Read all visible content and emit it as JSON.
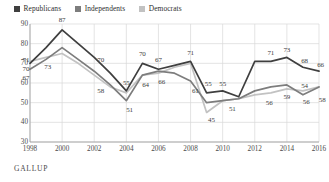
{
  "legend": {
    "position": "top-left",
    "items": [
      {
        "label": "Republicans",
        "color": "#3f3f3f",
        "icon": "legend-swatch-icon"
      },
      {
        "label": "Independents",
        "color": "#7d7d7d",
        "icon": "legend-swatch-icon"
      },
      {
        "label": "Democrats",
        "color": "#c2c2c2",
        "icon": "legend-swatch-icon"
      }
    ]
  },
  "source": {
    "label": "GALLUP"
  },
  "chart_data": {
    "type": "line",
    "title": "",
    "subtitle": "",
    "xlabel": "",
    "ylabel": "",
    "grid": true,
    "legend_position": "top-left",
    "ylim": [
      30,
      90
    ],
    "yticks": [
      30,
      40,
      50,
      60,
      70,
      80,
      90
    ],
    "xlim": [
      1998,
      2016
    ],
    "xticks": [
      1998,
      2000,
      2002,
      2004,
      2006,
      2008,
      2010,
      2012,
      2014,
      2016
    ],
    "x": [
      1998,
      1999,
      2000,
      2001,
      2002,
      2003,
      2004,
      2005,
      2006,
      2007,
      2008,
      2009,
      2010,
      2011,
      2012,
      2013,
      2014,
      2015,
      2016
    ],
    "series": [
      {
        "name": "Republicans",
        "color": "#3f3f3f",
        "values": [
          70,
          78,
          87,
          80,
          73,
          65,
          56,
          70,
          67,
          69,
          71,
          55,
          56,
          53,
          71,
          71,
          73,
          68,
          66
        ]
      },
      {
        "name": "Independents",
        "color": "#7d7d7d",
        "values": [
          67,
          72,
          78,
          72,
          66,
          59,
          51,
          64,
          66,
          65,
          61,
          50,
          51,
          52,
          56,
          58,
          59,
          54,
          58
        ]
      },
      {
        "name": "Democrats",
        "color": "#c2c2c2",
        "values": [
          71,
          73,
          75,
          70,
          64,
          58,
          55,
          64,
          65,
          68,
          70,
          45,
          51,
          52,
          54,
          55,
          57,
          56,
          58
        ]
      }
    ],
    "point_labels": [
      {
        "text": "71",
        "x": 1998.0,
        "y": 71.5,
        "anchor": "left"
      },
      {
        "text": "70",
        "x": 1998.0,
        "y": 67.0,
        "anchor": "left"
      },
      {
        "text": "67",
        "x": 1998.0,
        "y": 62.5,
        "anchor": "left"
      },
      {
        "text": "73",
        "x": 1999.1,
        "y": 68.0,
        "anchor": "center"
      },
      {
        "text": "87",
        "x": 2000.0,
        "y": 92.0,
        "anchor": "center"
      },
      {
        "text": "70",
        "x": 2002.4,
        "y": 71.5,
        "anchor": "center"
      },
      {
        "text": "58",
        "x": 2002.4,
        "y": 56.0,
        "anchor": "center"
      },
      {
        "text": "55",
        "x": 2004.0,
        "y": 60.0,
        "anchor": "center"
      },
      {
        "text": "51",
        "x": 2004.2,
        "y": 46.5,
        "anchor": "center"
      },
      {
        "text": "70",
        "x": 2005.0,
        "y": 74.5,
        "anchor": "center"
      },
      {
        "text": "64",
        "x": 2005.2,
        "y": 59.0,
        "anchor": "center"
      },
      {
        "text": "67",
        "x": 2006.0,
        "y": 71.5,
        "anchor": "center"
      },
      {
        "text": "66",
        "x": 2006.2,
        "y": 60.5,
        "anchor": "center"
      },
      {
        "text": "71",
        "x": 2008.0,
        "y": 75.5,
        "anchor": "center"
      },
      {
        "text": "61",
        "x": 2008.3,
        "y": 56.0,
        "anchor": "center"
      },
      {
        "text": "55",
        "x": 2009.1,
        "y": 59.5,
        "anchor": "center"
      },
      {
        "text": "55",
        "x": 2010.0,
        "y": 59.5,
        "anchor": "center"
      },
      {
        "text": "45",
        "x": 2009.3,
        "y": 41.0,
        "anchor": "center"
      },
      {
        "text": "51",
        "x": 2010.6,
        "y": 47.0,
        "anchor": "center"
      },
      {
        "text": "71",
        "x": 2013.0,
        "y": 75.5,
        "anchor": "center"
      },
      {
        "text": "73",
        "x": 2014.0,
        "y": 77.0,
        "anchor": "center"
      },
      {
        "text": "68",
        "x": 2015.1,
        "y": 71.0,
        "anchor": "center"
      },
      {
        "text": "66",
        "x": 2016.1,
        "y": 69.0,
        "anchor": "center"
      },
      {
        "text": "56",
        "x": 2012.9,
        "y": 50.0,
        "anchor": "center"
      },
      {
        "text": "59",
        "x": 2014.0,
        "y": 53.0,
        "anchor": "center"
      },
      {
        "text": "54",
        "x": 2015.1,
        "y": 58.5,
        "anchor": "center"
      },
      {
        "text": "56",
        "x": 2015.2,
        "y": 50.5,
        "anchor": "center"
      },
      {
        "text": "58",
        "x": 2016.2,
        "y": 51.5,
        "anchor": "center"
      }
    ]
  }
}
